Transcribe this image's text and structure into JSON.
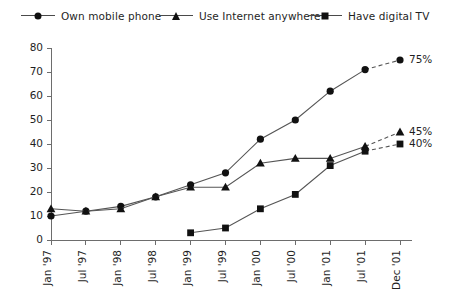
{
  "legend": {
    "entries": [
      {
        "label": "Own mobile phone",
        "marker": "circle-icon"
      },
      {
        "label": "Use Internet anywhere",
        "marker": "triangle-icon"
      },
      {
        "label": "Have digital TV",
        "marker": "square-icon"
      }
    ]
  },
  "chart_data": {
    "type": "line",
    "title": "",
    "subtitle": "",
    "xlabel": "",
    "ylabel": "",
    "categories": [
      "Jan '97",
      "Jul '97",
      "Jan '98",
      "Jul '98",
      "Jan '99",
      "Jul '99",
      "Jan '00",
      "Jul '00",
      "Jan '01",
      "Jul '01",
      "Dec '01"
    ],
    "ylim": [
      0,
      80
    ],
    "yticks": [
      0,
      10,
      20,
      30,
      40,
      50,
      60,
      70,
      80
    ],
    "ytick_labels": [
      "0",
      "10",
      "20",
      "30",
      "40",
      "50",
      "60",
      "70",
      "80"
    ],
    "grid": false,
    "legend_position": "top",
    "series": [
      {
        "name": "Own mobile phone",
        "marker": "circle",
        "values": [
          10,
          12,
          14,
          18,
          23,
          28,
          42,
          50,
          62,
          71,
          75
        ],
        "end_label": "75%",
        "forecast_from_index": 9
      },
      {
        "name": "Use Internet anywhere",
        "marker": "triangle",
        "values": [
          13,
          12,
          13,
          18,
          22,
          22,
          32,
          34,
          34,
          39,
          45
        ],
        "end_label": "45%",
        "forecast_from_index": 9
      },
      {
        "name": "Have digital TV",
        "marker": "square",
        "values": [
          null,
          null,
          null,
          null,
          3,
          5,
          13,
          19,
          31,
          37,
          40
        ],
        "end_label": "40%",
        "forecast_from_index": 9
      }
    ],
    "colors": {
      "series": "#111111",
      "axis": "#6d6d6d",
      "text": "#1f1f1f",
      "background": "#ffffff"
    }
  }
}
